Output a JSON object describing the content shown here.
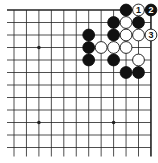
{
  "diagram": {
    "type": "go-board-fragment",
    "corner": "top-right",
    "grid": {
      "columns": 12,
      "rows": 12,
      "x0": 14,
      "y0": 10,
      "spacing_x": 12.45,
      "spacing_y": 12.5,
      "line_color": "#222222",
      "edge_top": true,
      "edge_right": true
    },
    "star_points": [
      {
        "col": 2,
        "row": 3
      },
      {
        "col": 2,
        "row": 9
      },
      {
        "col": 8,
        "row": 9
      }
    ],
    "stones": [
      {
        "col": 9,
        "row": 0,
        "color": "black",
        "label": ""
      },
      {
        "col": 10,
        "row": 0,
        "color": "white",
        "label": "1"
      },
      {
        "col": 11,
        "row": 0,
        "color": "black",
        "label": "2"
      },
      {
        "col": 8,
        "row": 1,
        "color": "black",
        "label": ""
      },
      {
        "col": 9,
        "row": 1,
        "color": "white",
        "label": ""
      },
      {
        "col": 10,
        "row": 1,
        "color": "black",
        "label": ""
      },
      {
        "col": 6,
        "row": 2,
        "color": "black",
        "label": ""
      },
      {
        "col": 8,
        "row": 2,
        "color": "black",
        "label": ""
      },
      {
        "col": 9,
        "row": 2,
        "color": "white",
        "label": ""
      },
      {
        "col": 10,
        "row": 2,
        "color": "white",
        "label": ""
      },
      {
        "col": 11,
        "row": 2,
        "color": "white",
        "label": "3"
      },
      {
        "col": 6,
        "row": 3,
        "color": "black",
        "label": ""
      },
      {
        "col": 7,
        "row": 3,
        "color": "white",
        "label": ""
      },
      {
        "col": 8,
        "row": 3,
        "color": "white",
        "label": ""
      },
      {
        "col": 9,
        "row": 3,
        "color": "white",
        "label": ""
      },
      {
        "col": 6,
        "row": 4,
        "color": "black",
        "label": ""
      },
      {
        "col": 8,
        "row": 4,
        "color": "black",
        "label": ""
      },
      {
        "col": 10,
        "row": 4,
        "color": "white",
        "label": ""
      },
      {
        "col": 9,
        "row": 5,
        "color": "black",
        "label": ""
      },
      {
        "col": 10,
        "row": 5,
        "color": "black",
        "label": ""
      }
    ],
    "colors": {
      "black_stone": "#111111",
      "white_stone": "#ffffff",
      "stone_outline": "#111111",
      "label_on_black": "#ffffff",
      "label_on_white": "#111111"
    }
  }
}
